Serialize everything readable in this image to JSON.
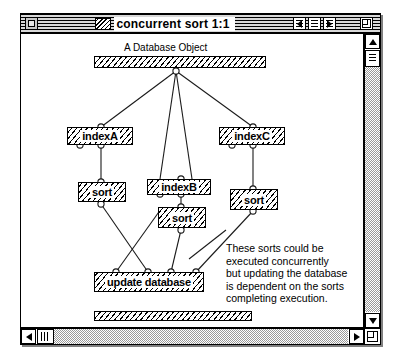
{
  "window": {
    "title": "concurrent sort 1:1",
    "close_button": "close-box",
    "titlebar_buttons": [
      {
        "name": "prev-button",
        "glyph": "◀"
      },
      {
        "name": "list-button",
        "glyph": "≡"
      },
      {
        "name": "next-button",
        "glyph": "▶"
      },
      {
        "name": "zoom-button",
        "glyph": "⌐"
      }
    ]
  },
  "diagram": {
    "caption": "A Database Object",
    "database_bar": {
      "label": "",
      "name": "database-object-bar"
    },
    "bottom_bar": {
      "label": "",
      "name": "bottom-object-bar"
    },
    "nodes": [
      {
        "id": "indexA",
        "label": "indexA"
      },
      {
        "id": "indexB",
        "label": "indexB"
      },
      {
        "id": "indexC",
        "label": "indexC"
      },
      {
        "id": "sortA",
        "label": "sort"
      },
      {
        "id": "sortB",
        "label": "sort"
      },
      {
        "id": "sortC",
        "label": "sort"
      },
      {
        "id": "update",
        "label": "update database"
      }
    ],
    "annotation": {
      "lines": [
        "These sorts could be",
        "executed concurrently",
        "but updating the database",
        "is dependent on the sorts",
        "completing execution."
      ]
    }
  },
  "scrollbars": {
    "vertical": {
      "up": "▲",
      "down": "▼"
    },
    "horizontal": {
      "left": "◀",
      "right": "▶"
    },
    "grow": "resize-handle"
  },
  "colors": {
    "window_bg": "#ffffff",
    "frame": "#000000",
    "track": "#9a9a9a",
    "shadow": "#808080"
  }
}
